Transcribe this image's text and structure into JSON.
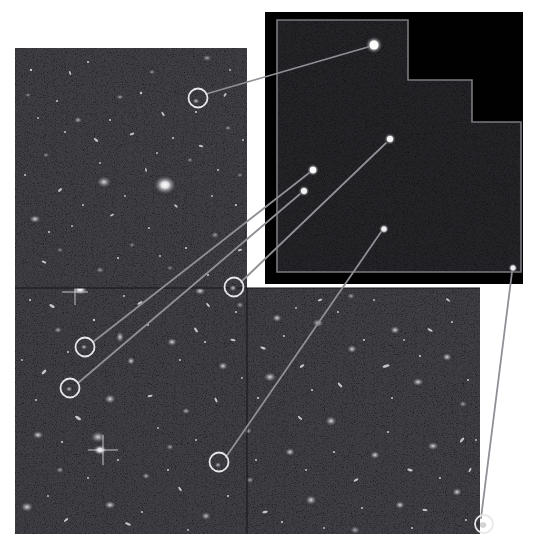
{
  "figure": {
    "kind": "astronomical-composite",
    "background_color": "#ffffff",
    "width": 540,
    "height": 556
  },
  "deep_field": {
    "name": "deep-field-mosaic",
    "sky_color": "#050507",
    "panels": [
      {
        "id": "upper-left-tile",
        "x": 15,
        "y": 48,
        "w": 232,
        "h": 240
      },
      {
        "id": "lower-wide-tile",
        "x": 15,
        "y": 288,
        "w": 465,
        "h": 246
      }
    ],
    "seam_color": "#111116"
  },
  "inset": {
    "name": "wfpc2-field-inset",
    "sky_color": "#010102",
    "outline_color": "#7a7a80",
    "outline_width": 1.6,
    "backdrop": {
      "x": 265,
      "y": 12,
      "w": 258,
      "h": 272
    },
    "outline_points": "277,20 408,20 408,80 472,80 472,122 521,122 521,272 277,272",
    "sources": [
      {
        "id": "inset-source-1",
        "cx": 374,
        "cy": 45,
        "r": 6.2,
        "brightness": 1.0
      },
      {
        "id": "inset-source-2",
        "cx": 390,
        "cy": 139,
        "r": 4.2,
        "brightness": 0.85
      },
      {
        "id": "inset-source-3",
        "cx": 313,
        "cy": 170,
        "r": 4.4,
        "brightness": 0.9
      },
      {
        "id": "inset-source-4",
        "cx": 304,
        "cy": 191,
        "r": 4.0,
        "brightness": 0.8
      },
      {
        "id": "inset-source-5",
        "cx": 384,
        "cy": 229,
        "r": 3.6,
        "brightness": 0.75
      },
      {
        "id": "inset-source-6",
        "cx": 513,
        "cy": 268,
        "r": 3.4,
        "brightness": 0.7
      }
    ]
  },
  "markers": {
    "circle_color": "#e8e8ea",
    "circle_width": 1.8,
    "items": [
      {
        "id": "marker-a",
        "cx": 198,
        "cy": 98,
        "r": 9.5
      },
      {
        "id": "marker-b",
        "cx": 234,
        "cy": 287,
        "r": 9.5
      },
      {
        "id": "marker-c",
        "cx": 85,
        "cy": 347,
        "r": 9.5
      },
      {
        "id": "marker-d",
        "cx": 70,
        "cy": 388,
        "r": 9.5
      },
      {
        "id": "marker-e",
        "cx": 219,
        "cy": 462,
        "r": 9.5
      },
      {
        "id": "marker-f",
        "cx": 484,
        "cy": 524,
        "r": 9.0
      }
    ]
  },
  "connectors": {
    "color": "#8f8f95",
    "width": 1.8,
    "items": [
      {
        "id": "connector-a",
        "x1": 206,
        "y1": 94,
        "x2": 368,
        "y2": 47
      },
      {
        "id": "connector-b",
        "x1": 241,
        "y1": 282,
        "x2": 386,
        "y2": 143
      },
      {
        "id": "connector-c",
        "x1": 93,
        "y1": 342,
        "x2": 309,
        "y2": 173
      },
      {
        "id": "connector-d",
        "x1": 78,
        "y1": 383,
        "x2": 300,
        "y2": 194
      },
      {
        "id": "connector-e",
        "x1": 226,
        "y1": 457,
        "x2": 381,
        "y2": 232
      },
      {
        "id": "connector-f",
        "x1": 481,
        "y1": 518,
        "x2": 512,
        "y2": 272
      }
    ]
  },
  "galaxies": {
    "name": "field-galaxy-population",
    "bright": [
      {
        "cx": 165,
        "cy": 185,
        "rx": 11,
        "ry": 9,
        "i": 1.0
      },
      {
        "cx": 104,
        "cy": 182,
        "rx": 7,
        "ry": 5,
        "i": 0.75
      },
      {
        "cx": 35,
        "cy": 219,
        "rx": 5,
        "ry": 4,
        "i": 0.7
      },
      {
        "cx": 80,
        "cy": 289,
        "rx": 7,
        "ry": 5,
        "i": 0.8
      },
      {
        "cx": 158,
        "cy": 281,
        "rx": 8,
        "ry": 5,
        "i": 0.72
      },
      {
        "cx": 200,
        "cy": 291,
        "rx": 6,
        "ry": 4,
        "i": 0.66
      },
      {
        "cx": 254,
        "cy": 216,
        "rx": 5,
        "ry": 4,
        "i": 0.62
      },
      {
        "cx": 120,
        "cy": 337,
        "rx": 4,
        "ry": 6,
        "i": 0.6
      },
      {
        "cx": 110,
        "cy": 399,
        "rx": 6,
        "ry": 5,
        "i": 0.7
      },
      {
        "cx": 76,
        "cy": 292,
        "rx": 4,
        "ry": 3,
        "i": 0.6
      },
      {
        "cx": 172,
        "cy": 342,
        "rx": 5,
        "ry": 4,
        "i": 0.66
      },
      {
        "cx": 131,
        "cy": 361,
        "rx": 4,
        "ry": 4,
        "i": 0.58
      },
      {
        "cx": 223,
        "cy": 366,
        "rx": 5,
        "ry": 4,
        "i": 0.62
      },
      {
        "cx": 98,
        "cy": 437,
        "rx": 8,
        "ry": 6,
        "i": 0.78
      },
      {
        "cx": 38,
        "cy": 435,
        "rx": 6,
        "ry": 4,
        "i": 0.62
      },
      {
        "cx": 100,
        "cy": 450,
        "rx": 7,
        "ry": 5,
        "i": 0.85
      },
      {
        "cx": 27,
        "cy": 507,
        "rx": 7,
        "ry": 5,
        "i": 0.76
      },
      {
        "cx": 110,
        "cy": 505,
        "rx": 6,
        "ry": 4,
        "i": 0.66
      },
      {
        "cx": 277,
        "cy": 318,
        "rx": 5,
        "ry": 4,
        "i": 0.64
      },
      {
        "cx": 318,
        "cy": 323,
        "rx": 6,
        "ry": 4,
        "i": 0.66
      },
      {
        "cx": 270,
        "cy": 377,
        "rx": 7,
        "ry": 5,
        "i": 0.74
      },
      {
        "cx": 352,
        "cy": 349,
        "rx": 5,
        "ry": 4,
        "i": 0.6
      },
      {
        "cx": 395,
        "cy": 330,
        "rx": 5,
        "ry": 4,
        "i": 0.6
      },
      {
        "cx": 418,
        "cy": 382,
        "rx": 6,
        "ry": 4,
        "i": 0.64
      },
      {
        "cx": 447,
        "cy": 357,
        "rx": 5,
        "ry": 4,
        "i": 0.58
      },
      {
        "cx": 331,
        "cy": 421,
        "rx": 6,
        "ry": 5,
        "i": 0.68
      },
      {
        "cx": 290,
        "cy": 452,
        "rx": 5,
        "ry": 4,
        "i": 0.6
      },
      {
        "cx": 375,
        "cy": 455,
        "rx": 5,
        "ry": 4,
        "i": 0.58
      },
      {
        "cx": 433,
        "cy": 446,
        "rx": 6,
        "ry": 4,
        "i": 0.64
      },
      {
        "cx": 311,
        "cy": 500,
        "rx": 6,
        "ry": 5,
        "i": 0.66
      },
      {
        "cx": 400,
        "cy": 505,
        "rx": 5,
        "ry": 4,
        "i": 0.6
      },
      {
        "cx": 457,
        "cy": 492,
        "rx": 5,
        "ry": 4,
        "i": 0.58
      },
      {
        "cx": 186,
        "cy": 411,
        "rx": 4,
        "ry": 3,
        "i": 0.55
      },
      {
        "cx": 248,
        "cy": 431,
        "rx": 4,
        "ry": 3,
        "i": 0.54
      },
      {
        "cx": 206,
        "cy": 516,
        "rx": 5,
        "ry": 4,
        "i": 0.6
      },
      {
        "cx": 146,
        "cy": 476,
        "rx": 4,
        "ry": 3,
        "i": 0.52
      }
    ],
    "spikes": [
      {
        "cx": 75,
        "cy": 292,
        "len": 13
      },
      {
        "cx": 103,
        "cy": 450,
        "len": 15
      },
      {
        "cx": 166,
        "cy": 185,
        "len": 10
      }
    ]
  },
  "labels": {
    "caption": ""
  }
}
